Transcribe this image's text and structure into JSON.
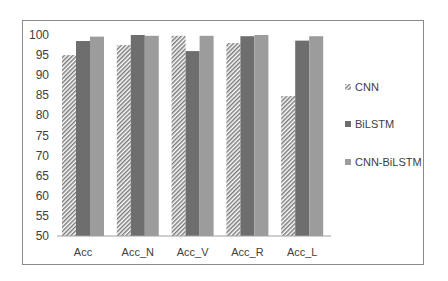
{
  "chart_data": {
    "type": "bar",
    "title": "",
    "xlabel": "",
    "ylabel": "",
    "ylim": [
      50,
      100
    ],
    "yticks": [
      50,
      55,
      60,
      65,
      70,
      75,
      80,
      85,
      90,
      95,
      100
    ],
    "grid": false,
    "legend_position": "right",
    "categories": [
      "Acc",
      "Acc_N",
      "Acc_V",
      "Acc_R",
      "Acc_L"
    ],
    "series": [
      {
        "name": "CNN",
        "fill": "hatch",
        "color": "#7a7a7a",
        "values": [
          95.0,
          97.5,
          99.8,
          98.0,
          84.8
        ]
      },
      {
        "name": "BiLSTM",
        "fill": "solid",
        "color": "#6e6e6e",
        "values": [
          98.5,
          100.0,
          96.0,
          99.7,
          98.6
        ]
      },
      {
        "name": "CNN-BiLSTM",
        "fill": "solid",
        "color": "#9c9c9c",
        "values": [
          99.6,
          99.8,
          99.8,
          100.0,
          99.7
        ]
      }
    ]
  }
}
